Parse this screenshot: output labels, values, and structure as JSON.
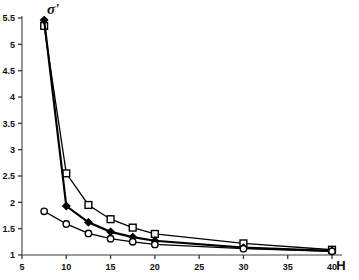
{
  "chart_data": {
    "type": "line",
    "title": "",
    "subtitle": "",
    "xlabel": "H",
    "ylabel": "σ'",
    "xlim": [
      5,
      40
    ],
    "ylim": [
      1,
      5.5
    ],
    "xticks": [
      5,
      10,
      15,
      20,
      25,
      30,
      35,
      40
    ],
    "xtick_labels": [
      "5",
      "10",
      "15",
      "20",
      "25",
      "30",
      "35",
      "40"
    ],
    "yticks": [
      1,
      1.5,
      2,
      2.5,
      3,
      3.5,
      4,
      4.5,
      5,
      5.5
    ],
    "ytick_labels": [
      "1",
      "1.5",
      "2",
      "2.5",
      "3",
      "3.5",
      "4",
      "4.5",
      "5",
      "5.5"
    ],
    "grid": false,
    "legend": "none",
    "series": [
      {
        "name": "open-square-series",
        "marker": "open-square",
        "marker_fill": "#ffffff",
        "marker_stroke": "#000000",
        "line_color": "#000000",
        "line_width": 1.3,
        "x": [
          7.5,
          10,
          12.5,
          15,
          17.5,
          20,
          30,
          40
        ],
        "values": [
          5.35,
          2.55,
          1.95,
          1.68,
          1.52,
          1.4,
          1.22,
          1.1
        ]
      },
      {
        "name": "filled-diamond-series",
        "marker": "filled-diamond",
        "marker_fill": "#000000",
        "marker_stroke": "#000000",
        "line_color": "#000000",
        "line_width": 2.2,
        "x": [
          7.5,
          10,
          12.5,
          15,
          17.5,
          20,
          30,
          40
        ],
        "values": [
          5.46,
          1.93,
          1.62,
          1.44,
          1.34,
          1.27,
          1.14,
          1.08
        ]
      },
      {
        "name": "open-circle-series",
        "marker": "open-circle",
        "marker_fill": "#ffffff",
        "marker_stroke": "#000000",
        "line_color": "#000000",
        "line_width": 1.3,
        "x": [
          7.5,
          10,
          12.5,
          15,
          17.5,
          20,
          30,
          40
        ],
        "values": [
          1.83,
          1.59,
          1.41,
          1.31,
          1.25,
          1.2,
          1.12,
          1.07
        ]
      }
    ],
    "colors": {
      "axis": "#7b7b7b",
      "ticks": "#3a3a3a",
      "text": "#111111",
      "background": "#ffffff",
      "line": "#000000"
    },
    "geometry": {
      "plot_left": 22,
      "plot_right": 332,
      "plot_top": 18,
      "plot_bottom": 255,
      "y_axis_x": 22,
      "x_axis_y": 255
    }
  }
}
